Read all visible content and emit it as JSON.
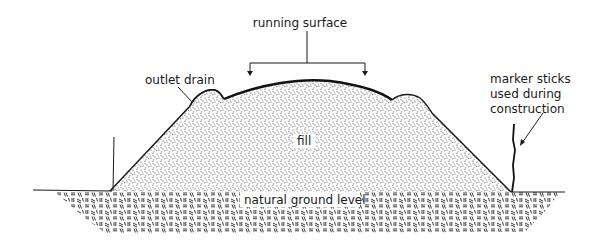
{
  "diagram": {
    "labels": {
      "running_surface": "running surface",
      "outlet_drain": "outlet drain",
      "fill": "fill",
      "natural_ground_level": "natural ground level",
      "marker_sticks": [
        "marker sticks",
        "used during",
        "construction"
      ]
    },
    "components": [
      "running-surface-bracket",
      "outlet-drain-left",
      "outlet-drain-right",
      "fill-embankment",
      "natural-ground",
      "marker-stick-left",
      "marker-stick-right"
    ],
    "colors": {
      "ink": "#1a1a1a",
      "background": "#ffffff"
    }
  }
}
